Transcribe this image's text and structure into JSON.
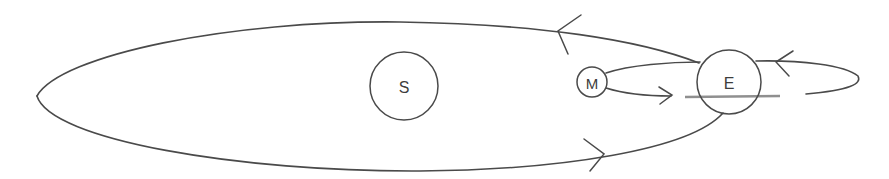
{
  "diagram": {
    "colors": {
      "stroke": "#4a4a4a",
      "background": "#ffffff"
    },
    "bodies": [
      {
        "id": "sun",
        "label": "S",
        "cx": 404,
        "cy": 86,
        "r": 34
      },
      {
        "id": "earth",
        "label": "E",
        "cx": 729,
        "cy": 82,
        "r": 32
      },
      {
        "id": "moon",
        "label": "M",
        "cx": 592,
        "cy": 82,
        "r": 15
      }
    ],
    "orbits": [
      {
        "id": "earth-orbit-around-sun",
        "direction": "counterclockwise"
      },
      {
        "id": "moon-orbit-around-earth",
        "direction": "counterclockwise"
      }
    ],
    "arrows": [
      {
        "id": "earth-orbit-top-arrow",
        "points_toward": "left"
      },
      {
        "id": "earth-orbit-bottom-arrow",
        "points_toward": "right"
      },
      {
        "id": "moon-orbit-lower-arrow",
        "points_toward": "right"
      },
      {
        "id": "moon-orbit-right-arrow",
        "points_toward": "left"
      }
    ]
  }
}
